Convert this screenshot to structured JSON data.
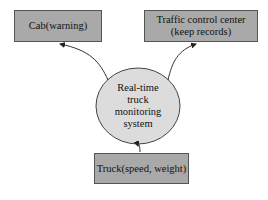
{
  "diagram": {
    "type": "data-flow",
    "nodes": {
      "cab": {
        "label": "Cab(warning)"
      },
      "traffic": {
        "line1": "Traffic control center",
        "line2": "(keep records)"
      },
      "system": {
        "line1": "Real-time",
        "line2": "truck",
        "line3": "monitoring",
        "line4": "system"
      },
      "truck": {
        "label": "Truck(speed, weight)"
      }
    },
    "edges": [
      {
        "from": "truck",
        "to": "system"
      },
      {
        "from": "system",
        "to": "cab"
      },
      {
        "from": "system",
        "to": "traffic"
      }
    ],
    "colors": {
      "box_fill": "#a9a9a9",
      "ellipse_fill": "#dcdcdc",
      "stroke": "#333333"
    }
  }
}
